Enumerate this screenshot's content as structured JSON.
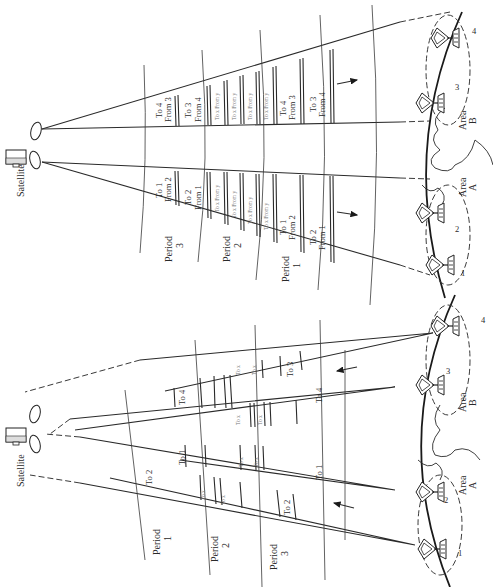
{
  "upper_panel": {
    "direction": "downlink (satellite to earth stations)",
    "satellite_label": "Satellite",
    "period_labels": [
      {
        "line1": "Period",
        "line2": "3"
      },
      {
        "line1": "Period",
        "line2": "2"
      },
      {
        "line1": "Period",
        "line2": "1"
      }
    ],
    "beam_area_b_packets": [
      {
        "line1": "To 4",
        "line2": "From 3"
      },
      {
        "line1": "To 3",
        "line2": "From 4"
      },
      {
        "line1": "To 4",
        "line2": "From 3"
      },
      {
        "line1": "To 3",
        "line2": "From 4"
      }
    ],
    "beam_area_a_packets": [
      {
        "line1": "To 1",
        "line2": "From 2"
      },
      {
        "line1": "To 2",
        "line2": "From 1"
      },
      {
        "line1": "To 1",
        "line2": "From 2"
      },
      {
        "line1": "To 2",
        "line2": "From 1"
      }
    ],
    "small_packet_label": "To x From y",
    "areas": [
      {
        "line1": "Area",
        "line2": "B"
      },
      {
        "line1": "Area",
        "line2": "A"
      }
    ],
    "station_numbers": [
      "4",
      "3",
      "2",
      "1"
    ]
  },
  "lower_panel": {
    "direction": "uplink (earth stations to satellite)",
    "satellite_label": "Satellite",
    "period_labels": [
      {
        "line1": "Period",
        "line2": "1"
      },
      {
        "line1": "Period",
        "line2": "2"
      },
      {
        "line1": "Period",
        "line2": "3"
      }
    ],
    "beam_packets": {
      "station_4": "To 3",
      "station_3": "To 4",
      "station_2": "To 1",
      "station_1": "To 2"
    },
    "near_satellite_packets": [
      "To 4",
      "To 1",
      "To 2"
    ],
    "small_packet_label": "To x",
    "areas": [
      {
        "line1": "Area",
        "line2": "B"
      },
      {
        "line1": "Area",
        "line2": "A"
      }
    ],
    "station_numbers": [
      "4",
      "3",
      "2",
      "1"
    ]
  },
  "colors": {
    "line": "#2a2a2a",
    "background": "#ffffff"
  }
}
